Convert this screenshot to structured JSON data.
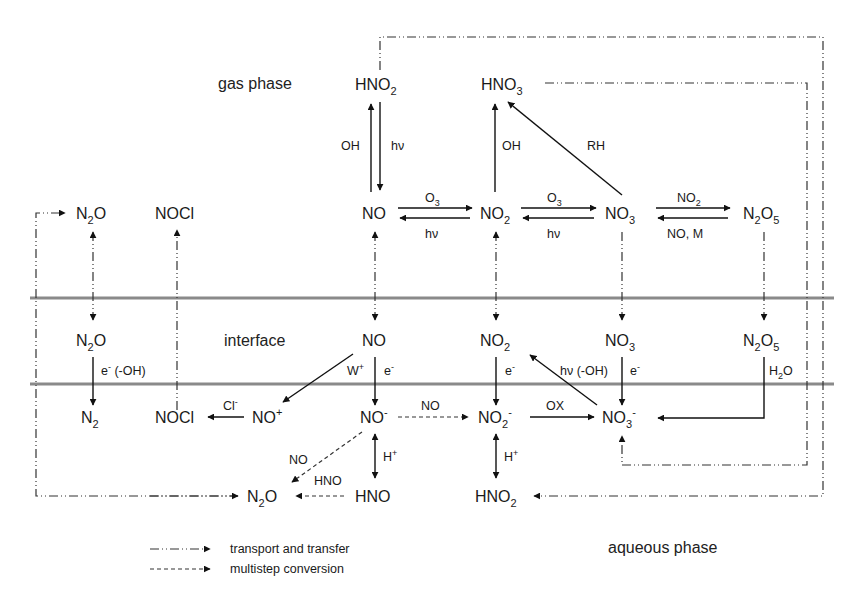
{
  "regions": {
    "gas": "gas phase",
    "interface": "interface",
    "aqueous": "aqueous phase"
  },
  "species": {
    "gas": {
      "hno2": {
        "base": "HNO",
        "sub": "2"
      },
      "hno3": {
        "base": "HNO",
        "sub": "3"
      },
      "n2o": {
        "base": "N",
        "sub": "2",
        "tail": "O"
      },
      "nocl": {
        "base": "NOCl"
      },
      "no": {
        "base": "NO"
      },
      "no2": {
        "base": "NO",
        "sub": "2"
      },
      "no3": {
        "base": "NO",
        "sub": "3"
      },
      "n2o5": {
        "base": "N",
        "sub": "2",
        "tail": "O",
        "sub2": "5"
      }
    },
    "interface": {
      "n2o": {
        "base": "N",
        "sub": "2",
        "tail": "O"
      },
      "no": {
        "base": "NO"
      },
      "no2": {
        "base": "NO",
        "sub": "2"
      },
      "no3": {
        "base": "NO",
        "sub": "3"
      },
      "n2o5": {
        "base": "N",
        "sub": "2",
        "tail": "O",
        "sub2": "5"
      }
    },
    "aqueous": {
      "n2": {
        "base": "N",
        "sub": "2"
      },
      "nocl": {
        "base": "NOCl"
      },
      "no_plus": {
        "base": "NO",
        "sup": "+"
      },
      "no_minus": {
        "base": "NO",
        "sup": "-"
      },
      "no2_minus": {
        "base": "NO",
        "sub": "2",
        "sup": "-"
      },
      "no3_minus": {
        "base": "NO",
        "sub": "3",
        "sup": "-"
      },
      "n2o": {
        "base": "N",
        "sub": "2",
        "tail": "O"
      },
      "hno": {
        "base": "HNO"
      },
      "hno2": {
        "base": "HNO",
        "sub": "2"
      }
    }
  },
  "reaction_labels": {
    "hno2_formation": "OH",
    "hno2_photolysis": "hν",
    "no2_to_hno3": "OH",
    "no3_to_hno3": "RH",
    "no_to_no2_top": {
      "base": "O",
      "sub": "3"
    },
    "no2_to_no_bottom": "hν",
    "no2_to_no3_top": {
      "base": "O",
      "sub": "3"
    },
    "no3_to_no2_bottom": "hν",
    "no3_to_n2o5_top": {
      "base": "NO",
      "sub": "2"
    },
    "n2o5_to_no3_bottom": "NO, M",
    "n2o_reduction": {
      "base": "e",
      "sup": "-",
      "tail": " (-OH)"
    },
    "no_oxidation": {
      "base": "W",
      "sup": "+"
    },
    "no_reduction": {
      "base": "e",
      "sup": "-"
    },
    "no2_reduction": {
      "base": "e",
      "sup": "-"
    },
    "no3_photolysis": "hν (-OH)",
    "no3_reduction": {
      "base": "e",
      "sup": "-"
    },
    "n2o5_hydrolysis": {
      "base": "H",
      "sub": "2",
      "tail": "O"
    },
    "chloride": {
      "base": "Cl",
      "sup": "-"
    },
    "no_minus_to_no2_minus": "NO",
    "no2_minus_oxidation": "OX",
    "protonation_no": {
      "base": "H",
      "sup": "+"
    },
    "protonation_no2": {
      "base": "H",
      "sup": "+"
    },
    "no_minus_to_n2o": "NO",
    "hno_to_n2o": "HNO"
  },
  "legend": {
    "items": [
      {
        "style": "dash-dot",
        "label": "transport and transfer"
      },
      {
        "style": "dashed",
        "label": "multistep conversion"
      }
    ]
  },
  "colors": {
    "line": "#111111",
    "band": "#8a8a8a",
    "text": "#1a1a1a",
    "background": "#ffffff"
  }
}
